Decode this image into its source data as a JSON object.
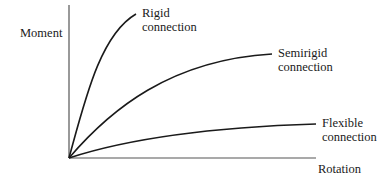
{
  "diagram": {
    "type": "moment-rotation curves",
    "axes": {
      "y_label": "Moment",
      "x_label": "Rotation"
    },
    "curves": [
      {
        "id": "rigid",
        "label_line1": "Rigid",
        "label_line2": "connection"
      },
      {
        "id": "semirigid",
        "label_line1": "Semirigid",
        "label_line2": "connection"
      },
      {
        "id": "flexible",
        "label_line1": "Flexible",
        "label_line2": "connection"
      }
    ],
    "colors": {
      "stroke": "#1a1a1a",
      "axis": "#555555",
      "background": "#ffffff"
    }
  }
}
